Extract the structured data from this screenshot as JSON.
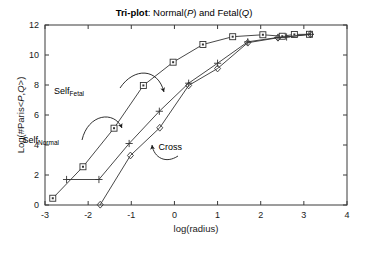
{
  "chart_data": {
    "type": "line",
    "title": "Tri-plot: Normal(P) and Fetal(Q)",
    "title_parts": {
      "bold": "Tri-plot",
      "rest_a": ": Normal(",
      "ital_a": "P",
      "rest_b": ") and Fetal(",
      "ital_b": "Q",
      "rest_c": ")"
    },
    "xlabel": "log(radius)",
    "ylabel": "Log(#Paris<P,Q>)",
    "ylabel_parts": {
      "pre": "Log(#Paris<",
      "ital_a": "P",
      "mid": ",",
      "ital_b": "Q",
      "post": ">)"
    },
    "xlim": [
      -3,
      4
    ],
    "ylim": [
      0,
      12
    ],
    "xticks": [
      -3,
      -2,
      -1,
      0,
      1,
      2,
      3,
      4
    ],
    "xtick_labels": [
      "-3",
      "-2",
      "-1",
      "0",
      "1",
      "2",
      "3",
      "4"
    ],
    "yticks": [
      0,
      2,
      4,
      6,
      8,
      10,
      12
    ],
    "ytick_labels": [
      "0",
      "2",
      "4",
      "6",
      "8",
      "10",
      "12"
    ],
    "grid": false,
    "legend": "annotations",
    "series": [
      {
        "name": "Self_Fetal",
        "marker": "square",
        "x": [
          -2.82,
          -2.12,
          -1.4,
          -0.72,
          -0.03,
          0.66,
          1.35,
          2.05,
          2.5,
          2.78,
          3.13
        ],
        "y": [
          0.45,
          2.55,
          5.12,
          7.97,
          9.52,
          10.7,
          11.22,
          11.35,
          11.25,
          11.37,
          11.38
        ]
      },
      {
        "name": "Self_Normal",
        "marker": "plus",
        "x": [
          -2.5,
          -1.75,
          -1.05,
          -0.35,
          0.33,
          1.0,
          1.7,
          2.4,
          2.6,
          3.15
        ],
        "y": [
          1.7,
          1.7,
          4.1,
          6.25,
          8.12,
          9.45,
          10.88,
          11.17,
          11.2,
          11.38
        ]
      },
      {
        "name": "Cross",
        "marker": "diamond",
        "x": [
          -1.72,
          -1.02,
          -0.34,
          0.33,
          1.0,
          1.7,
          2.4,
          3.15
        ],
        "y": [
          0.02,
          3.3,
          5.15,
          7.97,
          9.1,
          10.82,
          11.15,
          11.38
        ]
      }
    ],
    "annotations": [
      {
        "name": "self-fetal",
        "text": "Self",
        "sub": "Fetal",
        "label_x": 84,
        "label_y": 94,
        "arrow_start": [
          120,
          88
        ],
        "arrow_ctrl1": [
          134,
          67
        ],
        "arrow_ctrl2": [
          158,
          68
        ],
        "arrow_end": [
          164,
          92
        ],
        "head_angle": 72
      },
      {
        "name": "self-normal",
        "text": "Self",
        "sub": "Normal",
        "label_x": 59,
        "label_y": 143,
        "arrow_start": [
          82,
          140
        ],
        "arrow_ctrl1": [
          88,
          114
        ],
        "arrow_ctrl2": [
          114,
          110
        ],
        "arrow_end": [
          122,
          128
        ],
        "head_angle": 66
      },
      {
        "name": "cross",
        "text": "Cross",
        "sub": "",
        "label_x": 182,
        "label_y": 150,
        "arrow_start": [
          178,
          156
        ],
        "arrow_ctrl1": [
          166,
          164
        ],
        "arrow_ctrl2": [
          154,
          158
        ],
        "arrow_end": [
          152,
          145
        ],
        "head_angle": -97
      }
    ],
    "colors": {
      "line": "#333333",
      "axis": "#3a3a3a",
      "text": "#000000",
      "background": "#ffffff"
    }
  }
}
